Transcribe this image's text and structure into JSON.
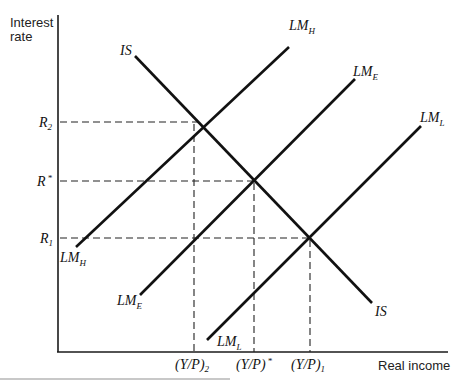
{
  "diagram": {
    "y_axis_label_line1": "Interest",
    "y_axis_label_line2": "rate",
    "x_axis_label": "Real income",
    "y_ticks": [
      {
        "label": "R",
        "sub": "2",
        "sup": ""
      },
      {
        "label": "R",
        "sub": "",
        "sup": "*"
      },
      {
        "label": "R",
        "sub": "1",
        "sup": ""
      }
    ],
    "x_ticks": [
      {
        "label": "(Y/P)",
        "sub": "2",
        "sup": ""
      },
      {
        "label": "(Y/P)",
        "sub": "",
        "sup": "*"
      },
      {
        "label": "(Y/P)",
        "sub": "1",
        "sup": ""
      }
    ],
    "curves": {
      "is": {
        "label": "IS"
      },
      "lm_h": {
        "label": "LM",
        "sub": "H"
      },
      "lm_e": {
        "label": "LM",
        "sub": "E"
      },
      "lm_l": {
        "label": "LM",
        "sub": "L"
      }
    },
    "intersections": [
      {
        "curves": "IS ∩ LM_H",
        "rate": "R2",
        "income": "(Y/P)2"
      },
      {
        "curves": "IS ∩ LM_E",
        "rate": "R*",
        "income": "(Y/P)*"
      },
      {
        "curves": "IS ∩ LM_L",
        "rate": "R1",
        "income": "(Y/P)1"
      }
    ]
  }
}
